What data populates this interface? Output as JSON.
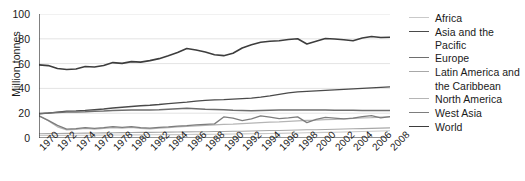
{
  "chart_data": {
    "type": "line",
    "title": "",
    "xlabel": "",
    "ylabel": "Million tonnes",
    "xlim": [
      1970,
      2008
    ],
    "ylim": [
      0,
      100
    ],
    "yticks": [
      0,
      20,
      40,
      60,
      80,
      100
    ],
    "xticks": [
      1970,
      1972,
      1974,
      1976,
      1978,
      1980,
      1982,
      1984,
      1986,
      1988,
      1990,
      1992,
      1994,
      1996,
      1998,
      2000,
      2002,
      2004,
      2006,
      2008
    ],
    "grid": true,
    "legend_position": "right",
    "x": [
      1970,
      1971,
      1972,
      1973,
      1974,
      1975,
      1976,
      1977,
      1978,
      1979,
      1980,
      1981,
      1982,
      1983,
      1984,
      1985,
      1986,
      1987,
      1988,
      1989,
      1990,
      1991,
      1992,
      1993,
      1994,
      1995,
      1996,
      1997,
      1998,
      1999,
      2000,
      2001,
      2002,
      2003,
      2004,
      2005,
      2006,
      2007,
      2008
    ],
    "series": [
      {
        "name": "Africa",
        "color": "#c9c9c9",
        "width": 1.1,
        "values": [
          2.0,
          2.0,
          2.1,
          2.1,
          2.2,
          2.2,
          2.3,
          2.3,
          2.4,
          2.4,
          2.5,
          2.5,
          2.6,
          2.6,
          2.7,
          2.7,
          2.8,
          2.9,
          2.9,
          3.0,
          3.1,
          3.2,
          3.3,
          3.4,
          3.5,
          3.6,
          3.7,
          3.9,
          4.0,
          4.2,
          4.3,
          4.5,
          4.6,
          4.8,
          5.0,
          5.2,
          5.4,
          5.6,
          5.8
        ]
      },
      {
        "name": "Asia and the Pacific",
        "color": "#4a4a4a",
        "width": 1.3,
        "values": [
          19.5,
          20.0,
          20.8,
          21.6,
          21.8,
          22.2,
          22.8,
          23.4,
          24.2,
          24.8,
          25.4,
          26.0,
          26.4,
          27.0,
          27.8,
          28.4,
          29.0,
          29.8,
          30.4,
          30.8,
          31.0,
          31.4,
          31.8,
          32.2,
          33.0,
          34.0,
          35.2,
          36.4,
          37.2,
          37.6,
          38.0,
          38.4,
          38.8,
          39.2,
          39.6,
          40.0,
          40.4,
          40.8,
          41.2
        ]
      },
      {
        "name": "Europe",
        "color": "#6e6e6e",
        "width": 1.5,
        "values": [
          19.8,
          20.2,
          20.6,
          21.0,
          21.0,
          21.2,
          21.6,
          21.8,
          22.2,
          22.4,
          22.6,
          22.6,
          22.6,
          22.8,
          23.2,
          23.6,
          24.0,
          23.6,
          23.2,
          23.0,
          22.8,
          22.4,
          22.2,
          22.0,
          22.2,
          22.4,
          22.6,
          22.6,
          22.6,
          22.6,
          22.6,
          22.6,
          22.4,
          22.4,
          22.4,
          22.2,
          22.2,
          22.2,
          22.2
        ]
      },
      {
        "name": "Latin America and the Caribbean",
        "color": "#a8a8a8",
        "width": 1.1,
        "values": [
          3.4,
          3.5,
          3.6,
          3.7,
          3.8,
          3.9,
          4.0,
          4.1,
          4.2,
          4.3,
          4.4,
          4.5,
          4.5,
          4.6,
          4.7,
          4.8,
          4.9,
          5.0,
          5.1,
          5.2,
          5.3,
          5.4,
          5.5,
          5.7,
          5.8,
          6.0,
          6.1,
          6.3,
          6.4,
          6.6,
          6.7,
          6.9,
          7.0,
          7.2,
          7.4,
          7.6,
          7.8,
          8.0,
          8.2
        ]
      },
      {
        "name": "North America",
        "color": "#b5b5b5",
        "width": 1.2,
        "values": [
          18.0,
          14.0,
          9.0,
          6.5,
          7.0,
          7.8,
          7.2,
          7.8,
          8.4,
          8.0,
          8.6,
          7.8,
          7.4,
          8.0,
          8.4,
          9.0,
          9.4,
          9.8,
          10.2,
          10.6,
          11.0,
          11.2,
          11.6,
          12.0,
          12.4,
          12.8,
          13.0,
          13.4,
          13.8,
          14.2,
          14.4,
          14.8,
          15.0,
          15.4,
          15.8,
          16.2,
          16.4,
          16.8,
          17.0
        ]
      },
      {
        "name": "West Asia",
        "color": "#7d7d7d",
        "width": 1.3,
        "values": [
          17.8,
          14.2,
          10.2,
          7.2,
          7.6,
          8.4,
          7.8,
          8.4,
          9.2,
          8.6,
          9.2,
          8.4,
          8.0,
          8.6,
          9.0,
          9.6,
          10.0,
          10.6,
          11.0,
          11.4,
          17.0,
          16.0,
          14.0,
          15.4,
          17.8,
          16.8,
          15.6,
          16.2,
          17.0,
          12.4,
          15.0,
          16.6,
          16.0,
          15.4,
          16.0,
          17.2,
          18.0,
          16.2,
          17.2
        ]
      },
      {
        "name": "World",
        "color": "#3d3d3d",
        "width": 1.6,
        "values": [
          59.0,
          58.4,
          56.0,
          55.2,
          55.6,
          57.6,
          57.2,
          58.4,
          60.8,
          60.2,
          61.6,
          61.2,
          62.4,
          64.0,
          66.4,
          69.0,
          72.2,
          71.0,
          69.4,
          67.2,
          66.4,
          68.4,
          72.6,
          75.2,
          77.2,
          78.0,
          78.4,
          79.4,
          80.0,
          75.8,
          78.0,
          80.2,
          79.8,
          79.2,
          78.4,
          80.6,
          81.8,
          81.0,
          81.2
        ]
      }
    ]
  },
  "legend": {
    "items": [
      {
        "label": "Africa",
        "continuation": ""
      },
      {
        "label": "Asia and the Pacific",
        "continuation": ""
      },
      {
        "label": "Europe",
        "continuation": ""
      },
      {
        "label": "Latin America and",
        "continuation": "the Caribbean"
      },
      {
        "label": "North America",
        "continuation": ""
      },
      {
        "label": "West Asia",
        "continuation": ""
      },
      {
        "label": "World",
        "continuation": ""
      }
    ]
  }
}
